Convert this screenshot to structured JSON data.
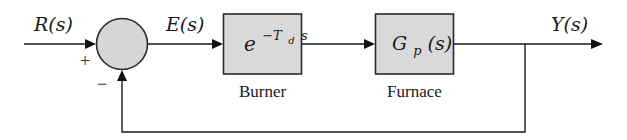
{
  "diagram": {
    "type": "feedback-control-block-diagram",
    "colors": {
      "line": "#1a1a1a",
      "block_fill": "#d9d9d9",
      "junction_fill": "#d6d6d6",
      "background": "#ffffff"
    },
    "signals": {
      "input": "R(s)",
      "error": "E(s)",
      "output": "Y(s)"
    },
    "summing_junction": {
      "plus_sign": "+",
      "minus_sign": "−"
    },
    "blocks": [
      {
        "id": "burner",
        "transfer_base": "e",
        "transfer_exponent_prefix": "−T",
        "transfer_exponent_sub": "d",
        "transfer_exponent_suffix": "s",
        "caption": "Burner"
      },
      {
        "id": "furnace",
        "transfer_main": "G",
        "transfer_sub": "p",
        "transfer_arg": "(s)",
        "caption": "Furnace"
      }
    ],
    "feedback": "unity negative feedback from Y(s) to summing junction"
  }
}
